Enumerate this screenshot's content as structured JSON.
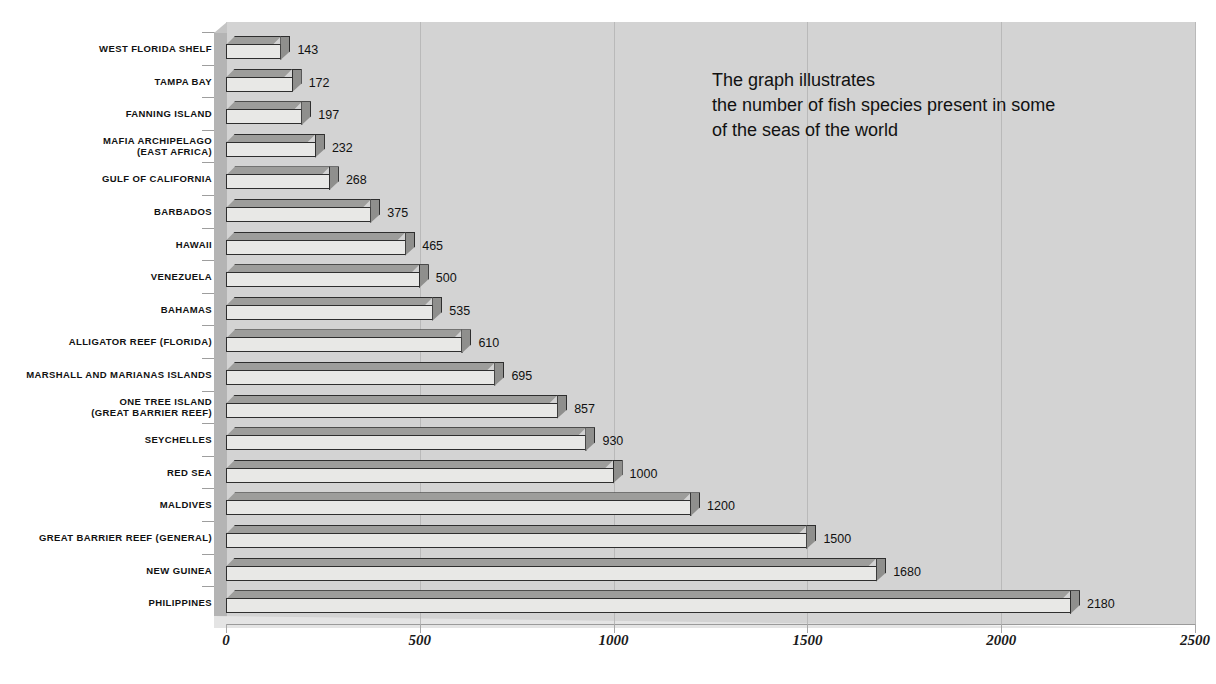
{
  "chart_data": {
    "type": "bar",
    "orientation": "horizontal",
    "title": "FISH SPECIES",
    "xlabel": "",
    "ylabel": "",
    "xlim": [
      0,
      2500
    ],
    "xticks": [
      0,
      500,
      1000,
      1500,
      2000,
      2500
    ],
    "xtick_labels": [
      "0",
      "500",
      "1000",
      "1500",
      "2000",
      "2500"
    ],
    "grid": true,
    "grid_axis": "x",
    "legend": false,
    "style_3d": true,
    "categories": [
      "WEST FLORIDA SHELF",
      "TAMPA BAY",
      "FANNING ISLAND",
      "MAFIA ARCHIPELAGO\n(EAST AFRICA)",
      "GULF OF CALIFORNIA",
      "BARBADOS",
      "HAWAII",
      "VENEZUELA",
      "BAHAMAS",
      "ALLIGATOR REEF (FLORIDA)",
      "MARSHALL AND MARIANAS ISLANDS",
      "ONE TREE ISLAND\n(GREAT BARRIER REEF)",
      "SEYCHELLES",
      "RED SEA",
      "MALDIVES",
      "GREAT BARRIER REEF (GENERAL)",
      "NEW GUINEA",
      "PHILIPPINES"
    ],
    "values": [
      143,
      172,
      197,
      232,
      268,
      375,
      465,
      500,
      535,
      610,
      695,
      857,
      930,
      1000,
      1200,
      1500,
      1680,
      2180
    ],
    "value_labels": [
      "143",
      "172",
      "197",
      "232",
      "268",
      "375",
      "465",
      "500",
      "535",
      "610",
      "695",
      "857",
      "930",
      "1000",
      "1200",
      "1500",
      "1680",
      "2180"
    ],
    "annotation": "The graph illustrates\nthe number of fish species present in some\nof the seas of the world"
  },
  "colors": {
    "plot_background": "#d3d3d3",
    "side_wall": "#b4b4b4",
    "bar_face": "#e8e8e6",
    "bar_top": "#9d9d9b",
    "bar_cap": "#8f8f8d",
    "bar_outline": "#2e2e2e",
    "gridline": "#b9b9b9",
    "text": "#111111",
    "page_background": "#ffffff"
  }
}
